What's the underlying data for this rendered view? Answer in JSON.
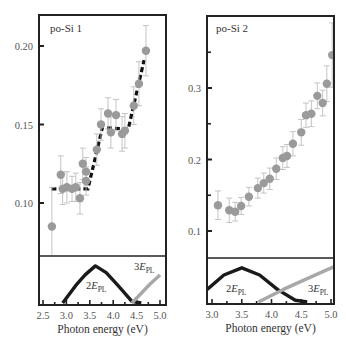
{
  "chart_data": [
    {
      "type": "scatter",
      "title": "po-Si 1",
      "xlabel": "Photon energy (eV)",
      "ylabel": "",
      "xlim": [
        2.5,
        5.0
      ],
      "ylim": [
        0.06,
        0.22
      ],
      "xticks": [
        "2.5",
        "3.0",
        "3.5",
        "4.0",
        "4.5",
        "5.0"
      ],
      "yticks": [
        "0.10",
        "0.15",
        "0.20"
      ],
      "grid": false,
      "series": [
        {
          "name": "data",
          "marker": "circle",
          "color": "#9a9a9a",
          "x": [
            2.69,
            2.88,
            2.92,
            3.01,
            3.12,
            3.2,
            3.29,
            3.35,
            3.42,
            3.42,
            3.65,
            3.74,
            3.89,
            3.95,
            4.06,
            4.19,
            4.25,
            4.44,
            4.55,
            4.7
          ],
          "y": [
            0.085,
            0.118,
            0.109,
            0.11,
            0.109,
            0.11,
            0.103,
            0.125,
            0.12,
            0.114,
            0.134,
            0.15,
            0.157,
            0.145,
            0.156,
            0.144,
            0.146,
            0.162,
            0.176,
            0.197
          ],
          "err": [
            0.025,
            0.012,
            0.01,
            0.01,
            0.008,
            0.009,
            0.01,
            0.01,
            0.009,
            0.009,
            0.01,
            0.01,
            0.01,
            0.01,
            0.01,
            0.011,
            0.011,
            0.012,
            0.014,
            0.016
          ]
        },
        {
          "name": "fit",
          "style": "dashed",
          "color": "#111111",
          "x": [
            2.68,
            3.46,
            3.77,
            4.32,
            4.66
          ],
          "y": [
            0.109,
            0.109,
            0.148,
            0.147,
            0.191
          ]
        }
      ],
      "inset": {
        "curves": [
          {
            "name": "2E_PL",
            "label": "2E",
            "sub": "PL",
            "color": "#1a1a1a",
            "x": [
              2.92,
              3.2,
              3.4,
              3.62,
              3.85,
              4.1,
              4.4,
              4.6
            ],
            "y": [
              0.0,
              0.45,
              0.72,
              0.95,
              0.78,
              0.45,
              0.04,
              0.0
            ]
          },
          {
            "name": "3E_PL",
            "label": "3E",
            "sub": "PL",
            "color": "#a8a8a8",
            "x": [
              4.4,
              4.6,
              4.8,
              5.0
            ],
            "y": [
              0.0,
              0.25,
              0.5,
              0.72
            ]
          }
        ]
      }
    },
    {
      "type": "scatter",
      "title": "po-Si 2",
      "xlabel": "Photon energy (eV)",
      "ylabel": "",
      "xlim": [
        2.9,
        5.05
      ],
      "ylim": [
        0.06,
        0.4
      ],
      "xticks": [
        "3.0",
        "3.5",
        "4.0",
        "4.5",
        "5.0"
      ],
      "yticks": [
        "0.1",
        "0.2",
        "0.3"
      ],
      "grid": false,
      "series": [
        {
          "name": "data",
          "marker": "circle",
          "color": "#9a9a9a",
          "x": [
            3.1,
            3.29,
            3.39,
            3.49,
            3.62,
            3.77,
            3.87,
            3.97,
            4.08,
            4.19,
            4.26,
            4.36,
            4.5,
            4.58,
            4.67,
            4.77,
            4.86,
            4.93,
            5.02
          ],
          "y": [
            0.136,
            0.129,
            0.127,
            0.135,
            0.148,
            0.16,
            0.167,
            0.173,
            0.187,
            0.202,
            0.205,
            0.222,
            0.238,
            0.262,
            0.264,
            0.289,
            0.279,
            0.306,
            0.346
          ],
          "err": [
            0.02,
            0.017,
            0.013,
            0.012,
            0.013,
            0.014,
            0.014,
            0.015,
            0.015,
            0.016,
            0.016,
            0.017,
            0.018,
            0.017,
            0.018,
            0.018,
            0.018,
            0.025,
            0.045
          ]
        }
      ],
      "inset": {
        "curves": [
          {
            "name": "2E_PL",
            "label": "2E",
            "sub": "PL",
            "color": "#1a1a1a",
            "x": [
              2.92,
              3.2,
              3.5,
              3.8,
              4.1,
              4.4,
              4.6
            ],
            "y": [
              0.35,
              0.75,
              0.95,
              0.75,
              0.35,
              0.05,
              0.0
            ]
          },
          {
            "name": "3E_PL",
            "label": "3E",
            "sub": "PL",
            "color": "#a8a8a8",
            "x": [
              3.78,
              4.2,
              4.6,
              5.05
            ],
            "y": [
              0.0,
              0.35,
              0.65,
              0.98
            ]
          }
        ]
      }
    }
  ],
  "labels": {
    "panel1": "po-Si 1",
    "panel2": "po-Si 2",
    "xlabel": "Photon energy (eV)",
    "e_main": "E",
    "pl_sub": "PL",
    "two": "2",
    "three": "3"
  }
}
